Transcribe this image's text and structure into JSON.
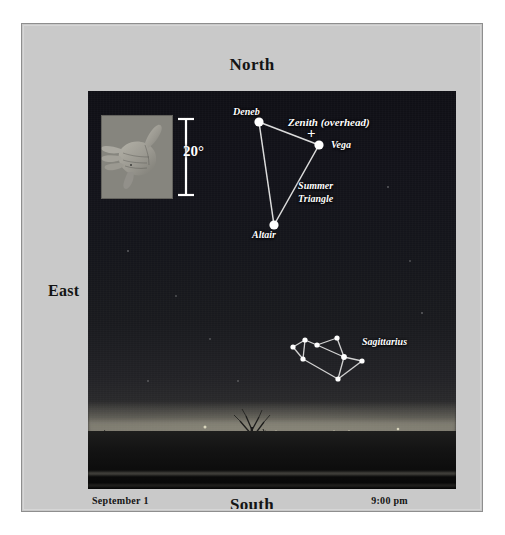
{
  "figure": {
    "type": "sky-map",
    "kind": "naked-eye star chart over photographic horizon"
  },
  "compass": {
    "north": "North",
    "south": "South",
    "east": "East",
    "west": "West"
  },
  "footer": {
    "date": "September 1",
    "time": "9:00 pm"
  },
  "scale": {
    "label": "20°",
    "icon": "hand-span-photo",
    "bar_icon": "vertical-scale-bar"
  },
  "zenith": {
    "label": "Zenith (overhead)",
    "marker": "+"
  },
  "asterisms": [
    {
      "name": "Summer Triangle",
      "label": "Summer\nTriangle",
      "label_line1": "Summer",
      "label_line2": "Triangle",
      "stars": [
        {
          "name": "Deneb",
          "x": 171,
          "y": 31,
          "r": 4.6
        },
        {
          "name": "Vega",
          "x": 231,
          "y": 54,
          "r": 4.6
        },
        {
          "name": "Altair",
          "x": 186,
          "y": 134,
          "r": 4.6
        }
      ],
      "lines": [
        [
          0,
          1
        ],
        [
          1,
          2
        ],
        [
          2,
          0
        ]
      ]
    },
    {
      "name": "Sagittarius",
      "label": "Sagittarius",
      "stars": [
        {
          "name": "s1",
          "x": 229,
          "y": 254,
          "r": 2.6
        },
        {
          "name": "s2",
          "x": 249,
          "y": 247,
          "r": 2.6
        },
        {
          "name": "s3",
          "x": 217,
          "y": 249,
          "r": 2.6
        },
        {
          "name": "s4",
          "x": 205,
          "y": 256,
          "r": 2.6
        },
        {
          "name": "s5",
          "x": 215,
          "y": 268,
          "r": 2.6
        },
        {
          "name": "s6",
          "x": 256,
          "y": 266,
          "r": 2.9
        },
        {
          "name": "s7",
          "x": 274,
          "y": 270,
          "r": 2.6
        },
        {
          "name": "s8",
          "x": 250,
          "y": 288,
          "r": 2.6
        }
      ],
      "lines": [
        [
          3,
          2
        ],
        [
          2,
          0
        ],
        [
          0,
          1
        ],
        [
          1,
          5
        ],
        [
          2,
          5
        ],
        [
          3,
          4
        ],
        [
          4,
          7
        ],
        [
          7,
          5
        ],
        [
          5,
          6
        ],
        [
          6,
          7
        ],
        [
          0,
          5
        ]
      ]
    }
  ],
  "star_labels": [
    {
      "name": "Deneb",
      "text": "Deneb"
    },
    {
      "name": "Vega",
      "text": "Vega"
    },
    {
      "name": "Altair",
      "text": "Altair"
    }
  ],
  "colors": {
    "panel_background": "#c9c9c9",
    "panel_border": "#8e8e8e",
    "sky_dark": "#101016",
    "star_white": "#ffffff",
    "constellation_line": "#d8d8d8",
    "text_dark": "#141414"
  }
}
